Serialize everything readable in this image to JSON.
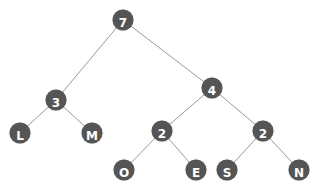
{
  "diagram": {
    "type": "binary-tree",
    "colors": {
      "node_fill": "#555555",
      "node_text": "#ffffff",
      "edge": "#9a9a9a",
      "background": "#ffffff"
    },
    "nodes": [
      {
        "id": "n7",
        "label": "7",
        "x": 123,
        "y": 20
      },
      {
        "id": "n3",
        "label": "3",
        "x": 56,
        "y": 100
      },
      {
        "id": "n4",
        "label": "4",
        "x": 212,
        "y": 88
      },
      {
        "id": "nL",
        "label": "L",
        "x": 20,
        "y": 133
      },
      {
        "id": "nM",
        "label": "M",
        "x": 92,
        "y": 133
      },
      {
        "id": "n2a",
        "label": "2",
        "x": 162,
        "y": 131
      },
      {
        "id": "n2b",
        "label": "2",
        "x": 263,
        "y": 131
      },
      {
        "id": "nO",
        "label": "O",
        "x": 124,
        "y": 170
      },
      {
        "id": "nE",
        "label": "E",
        "x": 196,
        "y": 170
      },
      {
        "id": "nS",
        "label": "S",
        "x": 227,
        "y": 170
      },
      {
        "id": "nN",
        "label": "N",
        "x": 299,
        "y": 170
      }
    ],
    "edges": [
      [
        "n7",
        "n3"
      ],
      [
        "n7",
        "n4"
      ],
      [
        "n3",
        "nL"
      ],
      [
        "n3",
        "nM"
      ],
      [
        "n4",
        "n2a"
      ],
      [
        "n4",
        "n2b"
      ],
      [
        "n2a",
        "nO"
      ],
      [
        "n2a",
        "nE"
      ],
      [
        "n2b",
        "nS"
      ],
      [
        "n2b",
        "nN"
      ]
    ]
  }
}
